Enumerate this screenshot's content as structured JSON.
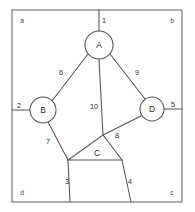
{
  "figure": {
    "type": "graph-diagram",
    "canvas": {
      "width": 195,
      "height": 212
    },
    "frame": {
      "name": "outer-boundary-rectangle",
      "x": 12,
      "y": 10,
      "width": 170,
      "height": 192,
      "color": "#6b6b6b"
    },
    "corner_labels": [
      {
        "id": "corner-a",
        "text": "a",
        "x": 22,
        "y": 20
      },
      {
        "id": "corner-b",
        "text": "b",
        "x": 172,
        "y": 20
      },
      {
        "id": "corner-d",
        "text": "d",
        "x": 22,
        "y": 192
      },
      {
        "id": "corner-c",
        "text": "c",
        "x": 172,
        "y": 192
      }
    ],
    "nodes": [
      {
        "id": "node-A",
        "label": "A",
        "shape": "circle",
        "cx": 99,
        "cy": 45,
        "r": 14
      },
      {
        "id": "node-B",
        "label": "B",
        "shape": "circle",
        "cx": 43,
        "cy": 110,
        "r": 13
      },
      {
        "id": "node-D",
        "label": "D",
        "shape": "circle",
        "cx": 152,
        "cy": 109,
        "r": 12
      },
      {
        "id": "node-C",
        "label": "C",
        "shape": "triangle",
        "cx": 97,
        "cy": 153,
        "points": "68,160 122,160 103,135"
      }
    ],
    "edges": [
      {
        "id": "edge-1",
        "label": "1",
        "from": "top-border",
        "to": "node-A",
        "path": "M 99 10 L 99 31",
        "label_x": 104,
        "label_y": 20
      },
      {
        "id": "edge-2",
        "label": "2",
        "from": "left-border",
        "to": "node-B",
        "path": "M 12 110 L 30 110",
        "label_x": 19,
        "label_y": 105
      },
      {
        "id": "edge-5",
        "label": "5",
        "from": "node-D",
        "to": "right-border",
        "path": "M 164 109 L 182 109",
        "label_x": 173,
        "label_y": 104
      },
      {
        "id": "edge-6",
        "label": "6",
        "from": "node-A",
        "to": "node-B",
        "path": "M 88 54 L 52 101",
        "label_x": 61,
        "label_y": 72
      },
      {
        "id": "edge-9",
        "label": "9",
        "from": "node-A",
        "to": "node-D",
        "path": "M 110 54 L 145 99",
        "label_x": 137,
        "label_y": 72
      },
      {
        "id": "edge-10",
        "label": "10",
        "from": "node-A",
        "to": "node-C",
        "path": "M 99 59 L 103 135",
        "label_x": 94,
        "label_y": 106
      },
      {
        "id": "edge-7",
        "label": "7",
        "from": "node-B",
        "to": "node-C-left",
        "path": "M 48 122 L 68 160",
        "label_x": 48,
        "label_y": 141
      },
      {
        "id": "edge-8",
        "label": "8",
        "from": "node-C",
        "to": "node-D",
        "path": "M 103 135 L 141 116",
        "label_x": 117,
        "label_y": 135
      },
      {
        "id": "edge-3",
        "label": "3",
        "from": "node-C-left",
        "to": "bottom-border",
        "path": "M 68 160 L 70 202",
        "label_x": 67,
        "label_y": 181
      },
      {
        "id": "edge-4",
        "label": "4",
        "from": "node-C-right",
        "to": "bottom-border",
        "path": "M 122 160 L 131 202",
        "label_x": 130,
        "label_y": 181
      }
    ]
  }
}
